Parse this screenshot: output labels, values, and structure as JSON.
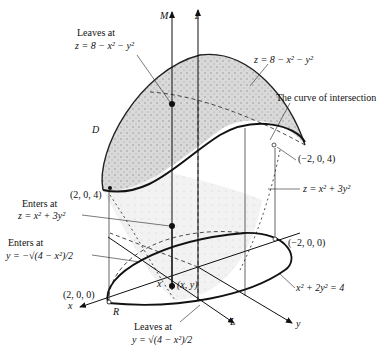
{
  "figure": {
    "axes": {
      "z": "z",
      "x": "x",
      "y": "y",
      "m": "M",
      "l": "L"
    },
    "region_labels": {
      "d": "D",
      "r": "R",
      "point_x": "x",
      "point_xy": "(x, y)"
    },
    "annotations": {
      "leaves_top_1": "Leaves at",
      "leaves_top_2": "z = 8 − x² − y²",
      "upper_surface": "z = 8 − x² − y²",
      "curve": "The curve of intersection",
      "pt_neg204": "(−2, 0, 4)",
      "pt_204": "(2, 0, 4)",
      "lower_surface": "z = x² + 3y²",
      "enters_z_1": "Enters at",
      "enters_z_2": "z = x² + 3y²",
      "enters_y_1": "Enters at",
      "enters_y_2": "y = −√(4 − x²)/2",
      "pt_neg200": "(−2, 0, 0)",
      "pt_200": "(2, 0, 0)",
      "ellipse": "x² + 2y² = 4",
      "leaves_y_1": "Leaves at",
      "leaves_y_2": "y = √(4 − x²)/2"
    }
  }
}
